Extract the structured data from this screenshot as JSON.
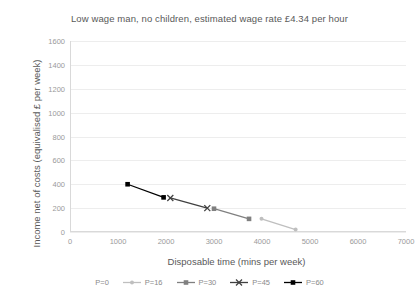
{
  "chart_data": {
    "type": "line",
    "title": "Low wage man, no children, estimated wage rate £4.34 per hour",
    "xlabel": "Disposable time (mins per week)",
    "ylabel": "Income net of costs (equivalised £ per week)",
    "xlim": [
      0,
      7000
    ],
    "ylim": [
      0,
      1600
    ],
    "xticks": [
      0,
      1000,
      2000,
      3000,
      4000,
      5000,
      6000,
      7000
    ],
    "yticks": [
      0,
      200,
      400,
      600,
      800,
      1000,
      1200,
      1400,
      1600
    ],
    "grid": "horizontal",
    "legend_position": "bottom",
    "series": [
      {
        "name": "P=0",
        "color": "#d9d9d9",
        "marker": "dot",
        "points": []
      },
      {
        "name": "P=16",
        "color": "#bfbfbf",
        "marker": "dot",
        "points": [
          [
            3990,
            110
          ],
          [
            4700,
            20
          ]
        ]
      },
      {
        "name": "P=30",
        "color": "#808080",
        "marker": "square",
        "points": [
          [
            3000,
            195
          ],
          [
            3730,
            110
          ]
        ]
      },
      {
        "name": "P=45",
        "color": "#404040",
        "marker": "cross",
        "points": [
          [
            2090,
            285
          ],
          [
            2860,
            200
          ]
        ]
      },
      {
        "name": "P=60",
        "color": "#000000",
        "marker": "square",
        "points": [
          [
            1200,
            400
          ],
          [
            1950,
            290
          ]
        ]
      }
    ]
  },
  "legend": {
    "items": [
      {
        "label": "P=0"
      },
      {
        "label": "P=16"
      },
      {
        "label": "P=30"
      },
      {
        "label": "P=45"
      },
      {
        "label": "P=60"
      }
    ]
  }
}
